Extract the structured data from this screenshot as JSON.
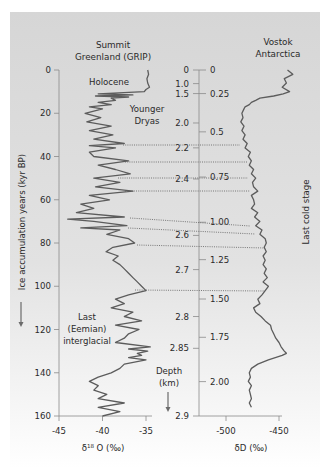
{
  "chart_data": {
    "type": "line",
    "panels": [
      {
        "name": "Summit Greenland (GRIP)",
        "title_lines": [
          "Summit",
          "Greenland (GRIP)"
        ],
        "xlabel": "δ18O (‰)",
        "xlabel_base": "δ",
        "xlabel_sup": "18",
        "xlabel_rest": " O (‰)",
        "xticks": [
          -45,
          -40,
          -35
        ],
        "xlim": [
          -45,
          -32
        ],
        "ylabel": "Ice accumulation years (kyr BP)",
        "yticks": [
          0,
          20,
          40,
          60,
          80,
          100,
          120,
          140,
          160
        ],
        "ylim": [
          0,
          160
        ],
        "y_inverted": true,
        "series": {
          "name": "GRIP δ18O",
          "age_kyr": [
            0,
            2,
            4,
            6,
            8,
            9,
            10,
            11,
            11.5,
            12,
            12.5,
            13,
            14,
            15,
            16,
            17,
            18,
            20,
            22,
            24,
            26,
            28,
            30,
            32,
            34,
            35,
            36,
            38,
            40,
            42,
            44,
            46,
            48,
            50,
            52,
            54,
            56,
            58,
            60,
            62,
            64,
            66,
            68,
            69,
            70,
            72,
            73,
            74,
            76,
            78,
            80,
            82,
            84,
            86,
            88,
            90,
            92,
            94,
            96,
            98,
            100,
            102,
            104,
            106,
            108,
            110,
            112,
            114,
            116,
            118,
            120,
            122,
            124,
            126,
            128,
            129,
            130,
            131,
            132,
            133,
            134,
            136,
            138,
            140,
            142,
            144,
            146,
            148,
            150,
            152,
            154,
            156,
            158,
            160
          ],
          "values": [
            -34.8,
            -34.7,
            -34.9,
            -34.8,
            -34.6,
            -35.0,
            -35.2,
            -40.5,
            -36.5,
            -40.8,
            -37.0,
            -39.0,
            -38.5,
            -40.5,
            -39.0,
            -41.5,
            -40.0,
            -42.0,
            -40.2,
            -41.8,
            -39.0,
            -41.5,
            -38.8,
            -41.0,
            -37.5,
            -41.5,
            -38.5,
            -41.5,
            -41.0,
            -37.0,
            -40.5,
            -38.5,
            -36.8,
            -41.0,
            -38.0,
            -40.8,
            -36.5,
            -41.5,
            -39.2,
            -42.5,
            -41.0,
            -43.0,
            -37.5,
            -44.0,
            -41.0,
            -37.2,
            -42.5,
            -38.0,
            -39.5,
            -37.0,
            -36.3,
            -38.8,
            -39.6,
            -38.2,
            -38.8,
            -38.0,
            -37.5,
            -37.0,
            -36.5,
            -36.0,
            -35.5,
            -35.0,
            -37.0,
            -38.5,
            -37.5,
            -39.0,
            -36.5,
            -37.5,
            -35.5,
            -38.5,
            -35.8,
            -37.0,
            -37.5,
            -38.5,
            -34.5,
            -37.0,
            -34.8,
            -36.0,
            -35.5,
            -37.0,
            -35.0,
            -37.5,
            -38.0,
            -39.0,
            -40.5,
            -41.5,
            -40.5,
            -41.0,
            -39.5,
            -40.5,
            -37.5,
            -40.5,
            -38.0,
            -40.0
          ]
        }
      },
      {
        "name": "Vostok Antarctica",
        "title_lines": [
          "Vostok",
          "Antarctica"
        ],
        "xlabel": "δD (‰)",
        "xticks": [
          -500,
          -450
        ],
        "xlim": [
          -527,
          -440
        ],
        "side_label": "Last cold stage",
        "series": {
          "name": "Vostok δD",
          "age_kyr": [
            0,
            2,
            4,
            6,
            8,
            10,
            11,
            12,
            13,
            14,
            15,
            16,
            17,
            18,
            20,
            22,
            24,
            26,
            28,
            30,
            32,
            34,
            36,
            38,
            40,
            42,
            44,
            46,
            48,
            50,
            52,
            54,
            56,
            58,
            60,
            62,
            64,
            66,
            68,
            70,
            72,
            74,
            76,
            78,
            80,
            82,
            84,
            86,
            88,
            90,
            92,
            94,
            96,
            98,
            100,
            102,
            104,
            106,
            108,
            110,
            112,
            114,
            116,
            118,
            120,
            122,
            124,
            126,
            128,
            130,
            131,
            132,
            134,
            136,
            138,
            140,
            142,
            144,
            146,
            148,
            150,
            152,
            154,
            156
          ],
          "values": [
            -442,
            -437,
            -445,
            -443,
            -447,
            -440,
            -446,
            -455,
            -468,
            -472,
            -476,
            -478,
            -482,
            -483,
            -485,
            -484,
            -486,
            -483,
            -485,
            -482,
            -484,
            -480,
            -482,
            -477,
            -479,
            -476,
            -478,
            -474,
            -476,
            -472,
            -475,
            -474,
            -470,
            -476,
            -474,
            -473,
            -476,
            -470,
            -473,
            -468,
            -472,
            -466,
            -468,
            -463,
            -462,
            -464,
            -462,
            -465,
            -463,
            -465,
            -462,
            -464,
            -461,
            -465,
            -460,
            -463,
            -466,
            -470,
            -468,
            -474,
            -472,
            -467,
            -463,
            -458,
            -457,
            -455,
            -453,
            -450,
            -448,
            -445,
            -443,
            -447,
            -460,
            -470,
            -476,
            -478,
            -477,
            -479,
            -476,
            -478,
            -477,
            -476,
            -478,
            -476
          ]
        }
      }
    ],
    "depth_axis": {
      "title_lines": [
        "Depth",
        "(km)"
      ],
      "grip_depths": [
        {
          "label": "0",
          "age": 0
        },
        {
          "label": "1.0",
          "age": 6.3
        },
        {
          "label": "1.5",
          "age": 10.9
        },
        {
          "label": "2.0",
          "age": 24.5
        },
        {
          "label": "2.2",
          "age": 36
        },
        {
          "label": "2.4",
          "age": 50.4
        },
        {
          "label": "2.6",
          "age": 76.5
        },
        {
          "label": "2.7",
          "age": 92.3
        },
        {
          "label": "2.8",
          "age": 114
        },
        {
          "label": "2.85",
          "age": 128.7
        },
        {
          "label": "2.9",
          "age": 160
        }
      ],
      "vostok_depths": [
        {
          "label": "0",
          "age": 0
        },
        {
          "label": "0.25",
          "age": 10.9
        },
        {
          "label": "0.5",
          "age": 28.6
        },
        {
          "label": "0.75",
          "age": 49.5
        },
        {
          "label": "1.00",
          "age": 70.4
        },
        {
          "label": "1.25",
          "age": 87.7
        },
        {
          "label": "1.50",
          "age": 105.9
        },
        {
          "label": "1.75",
          "age": 123.6
        },
        {
          "label": "2.00",
          "age": 144.1
        }
      ]
    },
    "annotations": [
      {
        "text_lines": [
          "Holocene"
        ],
        "age": 6
      },
      {
        "text_lines": [
          "Younger",
          "Dryas"
        ],
        "age": 15
      },
      {
        "text_lines": [
          "Last",
          "(Eemian)",
          "interglacial"
        ],
        "age": 120
      }
    ],
    "correlation_lines": [
      {
        "x1": 123,
        "y1": 145,
        "x2": 240,
        "y2": 145
      },
      {
        "x1": 125,
        "y1": 162,
        "x2": 248,
        "y2": 162
      },
      {
        "x1": 118,
        "y1": 178,
        "x2": 248,
        "y2": 178
      },
      {
        "x1": 125,
        "y1": 191,
        "x2": 250,
        "y2": 191
      },
      {
        "x1": 130,
        "y1": 218,
        "x2": 250,
        "y2": 226
      },
      {
        "x1": 128,
        "y1": 228,
        "x2": 255,
        "y2": 234
      },
      {
        "x1": 137,
        "y1": 245,
        "x2": 265,
        "y2": 248
      },
      {
        "x1": 135,
        "y1": 290,
        "x2": 265,
        "y2": 291
      }
    ],
    "colors": {
      "background_top": "#d6d6d6",
      "background_bottom": "#ffffff",
      "curve": "#5c5c5c",
      "axis": "#8a8a8a",
      "text": "#2a2a2a"
    }
  }
}
